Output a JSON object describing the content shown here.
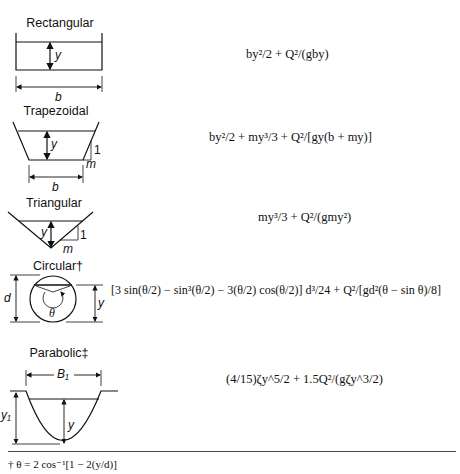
{
  "figure": {
    "sections": [
      {
        "name": "Rectangular",
        "dimensions": [
          "y",
          "b"
        ],
        "formula": "by²/2 + Q²/(gby)"
      },
      {
        "name": "Trapezoidal",
        "dimensions": [
          "y",
          "b",
          "1",
          "m"
        ],
        "formula": "by²/2 + my³/3 + Q²/[gy(b + my)]"
      },
      {
        "name": "Triangular",
        "dimensions": [
          "y",
          "1",
          "m"
        ],
        "formula": "my³/3 + Q²/(gmy²)"
      },
      {
        "name": "Circular†",
        "dimensions": [
          "d",
          "y",
          "θ"
        ],
        "formula": "[3 sin(θ/2) − sin³(θ/2) − 3(θ/2) cos(θ/2)] d³/24 + Q²/[gd²(θ − sin θ)/8]"
      },
      {
        "name": "Parabolic‡",
        "dimensions": [
          "B₁",
          "y₁",
          "y"
        ],
        "formula": "(4/15)ζy^5/2 + 1.5Q²/(gζy^3/2)"
      }
    ],
    "footnote": "† θ = 2 cos⁻¹[1 − 2(y/d)]"
  }
}
